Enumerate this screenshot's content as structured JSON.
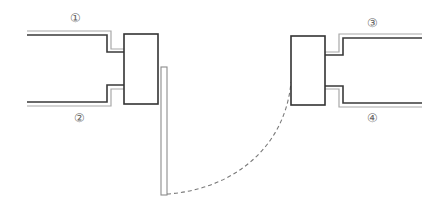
{
  "diagram": {
    "labels": [
      {
        "id": "label-1",
        "text": "①",
        "x": 75,
        "y": 18
      },
      {
        "id": "label-2",
        "text": "②",
        "x": 79,
        "y": 118
      },
      {
        "id": "label-3",
        "text": "③",
        "x": 372,
        "y": 23
      },
      {
        "id": "label-4",
        "text": "④",
        "x": 372,
        "y": 118
      }
    ],
    "colors": {
      "dark_line": "#3a3a3a",
      "light_line": "#a8a8a8",
      "dashed_arc": "#7a7a7a",
      "label_text": "#666666",
      "background": "#ffffff"
    }
  }
}
